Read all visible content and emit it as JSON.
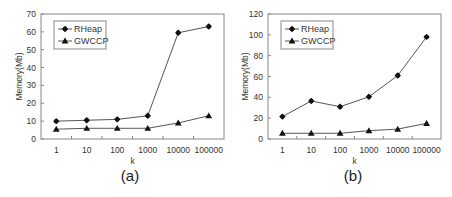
{
  "chart_data": [
    {
      "type": "line",
      "caption": "(a)",
      "title": "",
      "xlabel": "k",
      "ylabel": "Memory(Mb)",
      "categories": [
        "1",
        "10",
        "100",
        "1000",
        "10000",
        "100000"
      ],
      "ylim": [
        0,
        70
      ],
      "yticks": [
        0,
        10,
        20,
        30,
        40,
        50,
        60,
        70
      ],
      "grid": false,
      "legend_position": "top-left",
      "series": [
        {
          "name": "RHeap",
          "marker": "diamond",
          "values": [
            10,
            10.5,
            11,
            13,
            59.5,
            63
          ]
        },
        {
          "name": "GWCCP",
          "marker": "triangle",
          "values": [
            5.5,
            6,
            6,
            6,
            9,
            13
          ]
        }
      ]
    },
    {
      "type": "line",
      "caption": "(b)",
      "title": "",
      "xlabel": "k",
      "ylabel": "Memory(Mb)",
      "categories": [
        "1",
        "10",
        "100",
        "1000",
        "10000",
        "100000"
      ],
      "ylim": [
        0,
        120
      ],
      "yticks": [
        0,
        20,
        40,
        60,
        80,
        100,
        120
      ],
      "grid": false,
      "legend_position": "top-left",
      "series": [
        {
          "name": "RHeap",
          "marker": "diamond",
          "values": [
            21.5,
            36.5,
            31,
            40.5,
            61,
            98
          ]
        },
        {
          "name": "GWCCP",
          "marker": "triangle",
          "values": [
            5.5,
            5.5,
            5.5,
            8,
            9.5,
            15
          ]
        }
      ]
    }
  ],
  "colors": {
    "line": "#555555",
    "marker": "#111111",
    "frame": "#888888"
  }
}
